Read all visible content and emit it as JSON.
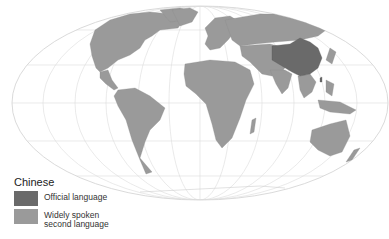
{
  "map": {
    "title": "Chinese",
    "projection": "Mollweide-style world map",
    "colors": {
      "official": "#6a6a6a",
      "second": "#9a9a9a",
      "graticule": "#d8d8d8",
      "ocean": "#ffffff"
    },
    "highlighted_regions": {
      "official_language": [
        "China",
        "Taiwan"
      ],
      "widely_spoken_second_language": [
        "All other land areas"
      ]
    }
  },
  "legend": {
    "title": "Chinese",
    "items": [
      {
        "label": "Official language",
        "color": "#6a6a6a"
      },
      {
        "label": "Widely spoken second language",
        "line1": "Widely spoken",
        "line2": "second language",
        "color": "#9a9a9a"
      }
    ]
  }
}
